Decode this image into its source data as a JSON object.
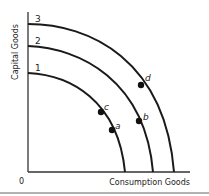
{
  "diagram": {
    "y_axis_label": "Capital Goods",
    "x_axis_label": "Consumption Goods",
    "origin_label": "0",
    "curves": [
      {
        "label": "1"
      },
      {
        "label": "2"
      },
      {
        "label": "3"
      }
    ],
    "points": [
      {
        "label": "a",
        "curve": "1"
      },
      {
        "label": "c",
        "curve": "1"
      },
      {
        "label": "b",
        "curve": "2"
      },
      {
        "label": "d",
        "curve": "3"
      }
    ],
    "colors": {
      "line": "#1a1a1a",
      "axis": "#333333",
      "text": "#222222",
      "footer_rule": "#999999"
    }
  }
}
